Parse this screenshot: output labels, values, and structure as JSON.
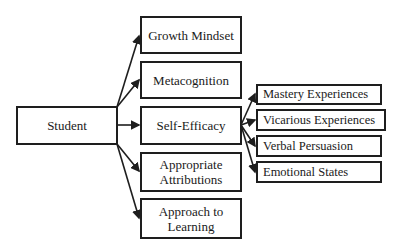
{
  "diagram": {
    "root": {
      "label": "Student"
    },
    "middle": [
      {
        "label": "Growth Mindset"
      },
      {
        "label": "Metacognition"
      },
      {
        "label": "Self-Efficacy"
      },
      {
        "label": "Appropriate\nAttributions",
        "lines": [
          "Appropriate",
          "Attributions"
        ]
      },
      {
        "label": "Approach to\nLearning",
        "lines": [
          "Approach to",
          "Learning"
        ]
      }
    ],
    "self_efficacy_sources": [
      {
        "label": "Mastery Experiences"
      },
      {
        "label": "Vicarious Experiences"
      },
      {
        "label": "Verbal Persuasion"
      },
      {
        "label": "Emotional States"
      }
    ],
    "colors": {
      "line": "#1e1e1e",
      "background": "#ffffff"
    }
  }
}
